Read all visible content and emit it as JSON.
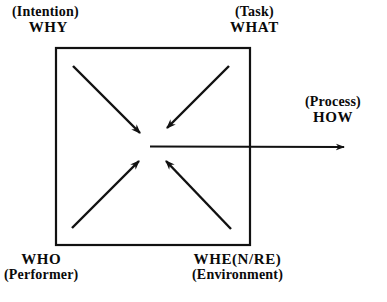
{
  "diagram": {
    "shape": {
      "type": "square",
      "stroke_color": "#111111",
      "stroke_width": 2,
      "x": 55,
      "y": 47,
      "width": 195,
      "height": 198
    },
    "labels": {
      "top_left": {
        "paren": "(Intention)",
        "word": "WHY"
      },
      "top_right": {
        "paren": "(Task)",
        "word": "WHAT"
      },
      "right": {
        "paren": "(Process)",
        "word": "HOW"
      },
      "bottom_left": {
        "word": "WHO",
        "paren": "(Performer)"
      },
      "bottom_right": {
        "word": "WHE(N/RE)",
        "paren": "(Environment)"
      }
    },
    "arrows": [
      {
        "name": "arrow-from-why",
        "from": [
          73,
          66
        ],
        "to": [
          142,
          135
        ],
        "direction": "inward-down-right"
      },
      {
        "name": "arrow-from-what",
        "from": [
          229,
          66
        ],
        "to": [
          165,
          130
        ],
        "direction": "inward-down-left"
      },
      {
        "name": "arrow-from-who",
        "from": [
          72,
          228
        ],
        "to": [
          141,
          160
        ],
        "direction": "inward-up-right"
      },
      {
        "name": "arrow-from-when",
        "from": [
          231,
          229
        ],
        "to": [
          164,
          160
        ],
        "direction": "inward-up-left"
      },
      {
        "name": "arrow-to-how",
        "from": [
          150,
          146
        ],
        "to": [
          345,
          147
        ],
        "direction": "outward-right"
      }
    ],
    "colors": {
      "ink": "#111111",
      "background": "#ffffff"
    }
  }
}
